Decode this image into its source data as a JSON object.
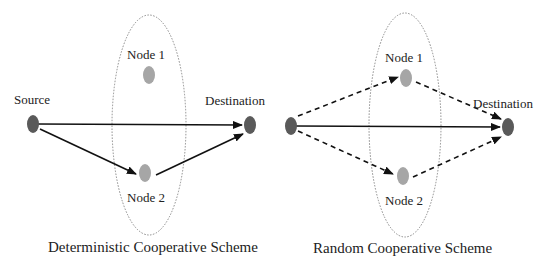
{
  "colors": {
    "endpoint_node": "#5a5a5a",
    "relay_node": "#a6a6a6",
    "arrow": "#111111",
    "ellipse": "#8a8a8a",
    "text": "#222222"
  },
  "diagrams": [
    {
      "caption": "Deterministic Cooperative Scheme",
      "labels": {
        "source": "Source",
        "destination": "Destination",
        "node1": "Node 1",
        "node2": "Node 2"
      },
      "links": [
        {
          "from": "Source",
          "to": "Destination",
          "style": "solid"
        },
        {
          "from": "Source",
          "to": "Node 2",
          "style": "solid"
        },
        {
          "from": "Node 2",
          "to": "Destination",
          "style": "solid"
        }
      ]
    },
    {
      "caption": "Random Cooperative Scheme",
      "labels": {
        "destination": "Destination",
        "node1": "Node 1",
        "node2": "Node 2"
      },
      "links": [
        {
          "from": "Source",
          "to": "Destination",
          "style": "solid"
        },
        {
          "from": "Source",
          "to": "Node 1",
          "style": "dashed"
        },
        {
          "from": "Source",
          "to": "Node 2",
          "style": "dashed"
        },
        {
          "from": "Node 1",
          "to": "Destination",
          "style": "dashed"
        },
        {
          "from": "Node 2",
          "to": "Destination",
          "style": "dashed"
        }
      ]
    }
  ]
}
